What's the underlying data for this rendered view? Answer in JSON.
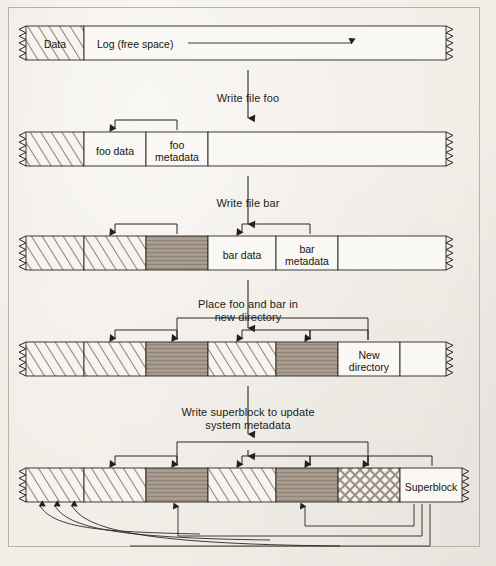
{
  "figure": {
    "kind": "log-structured-filesystem-sequence",
    "background_color": "#f2eee8",
    "ink_color": "#2b2722",
    "shade_color": "#a79c90",
    "stage_count": 5
  },
  "stages": [
    {
      "id": "stage-1",
      "y": 26,
      "transition_label": "Write file foo",
      "cells": [
        {
          "name": "data-region",
          "label": "Data",
          "pattern": "diagonal",
          "x": 26,
          "w": 58
        },
        {
          "name": "log-free-space",
          "label": "Log (free space)",
          "pattern": "empty",
          "x": 84,
          "w": 362
        }
      ]
    },
    {
      "id": "stage-2",
      "y": 132,
      "transition_label": "Write file bar",
      "cells": [
        {
          "name": "data-region",
          "label": "",
          "pattern": "diagonal",
          "x": 26,
          "w": 58
        },
        {
          "name": "foo-data",
          "label": "foo data",
          "pattern": "empty",
          "x": 84,
          "w": 62
        },
        {
          "name": "foo-metadata",
          "label": "foo\nmetadata",
          "pattern": "empty",
          "x": 146,
          "w": 62
        },
        {
          "name": "log-free-space",
          "label": "",
          "pattern": "empty",
          "x": 208,
          "w": 238
        }
      ]
    },
    {
      "id": "stage-3",
      "y": 236,
      "transition_label": "Place foo and bar in\nnew directory",
      "cells": [
        {
          "name": "data-region",
          "label": "",
          "pattern": "diagonal",
          "x": 26,
          "w": 58
        },
        {
          "name": "foo-data",
          "label": "",
          "pattern": "diagonal",
          "x": 84,
          "w": 62
        },
        {
          "name": "foo-metadata",
          "label": "",
          "pattern": "shaded",
          "x": 146,
          "w": 62
        },
        {
          "name": "bar-data",
          "label": "bar data",
          "pattern": "empty",
          "x": 208,
          "w": 68
        },
        {
          "name": "bar-metadata",
          "label": "bar\nmetadata",
          "pattern": "empty",
          "x": 276,
          "w": 62
        },
        {
          "name": "log-free-space",
          "label": "",
          "pattern": "empty",
          "x": 338,
          "w": 108
        }
      ]
    },
    {
      "id": "stage-4",
      "y": 342,
      "transition_label": "Write superblock to update\nsystem metadata",
      "cells": [
        {
          "name": "data-region",
          "label": "",
          "pattern": "diagonal",
          "x": 26,
          "w": 58
        },
        {
          "name": "foo-data",
          "label": "",
          "pattern": "diagonal",
          "x": 84,
          "w": 62
        },
        {
          "name": "foo-metadata",
          "label": "",
          "pattern": "shaded",
          "x": 146,
          "w": 62
        },
        {
          "name": "bar-data",
          "label": "",
          "pattern": "diagonal",
          "x": 208,
          "w": 68
        },
        {
          "name": "bar-metadata",
          "label": "",
          "pattern": "shaded",
          "x": 276,
          "w": 62
        },
        {
          "name": "new-directory",
          "label": "New\ndirectory",
          "pattern": "empty",
          "x": 338,
          "w": 62
        },
        {
          "name": "log-free-space",
          "label": "",
          "pattern": "empty",
          "x": 400,
          "w": 46
        }
      ]
    },
    {
      "id": "stage-5",
      "y": 468,
      "transition_label": "",
      "cells": [
        {
          "name": "data-region",
          "label": "",
          "pattern": "diagonal",
          "x": 26,
          "w": 58
        },
        {
          "name": "foo-data",
          "label": "",
          "pattern": "diagonal",
          "x": 84,
          "w": 62
        },
        {
          "name": "foo-metadata",
          "label": "",
          "pattern": "shaded",
          "x": 146,
          "w": 62
        },
        {
          "name": "bar-data",
          "label": "",
          "pattern": "diagonal",
          "x": 208,
          "w": 68
        },
        {
          "name": "bar-metadata",
          "label": "",
          "pattern": "shaded",
          "x": 276,
          "w": 62
        },
        {
          "name": "new-directory",
          "label": "",
          "pattern": "crosshatch",
          "x": 338,
          "w": 62
        },
        {
          "name": "superblock",
          "label": "Superblock",
          "pattern": "empty",
          "x": 400,
          "w": 62
        }
      ]
    }
  ],
  "log_direction_arrow": {
    "name": "log-growth-arrow",
    "label": "Log (free space)",
    "description": "arrow pointing right across the free log area"
  },
  "labels": {
    "data": "Data",
    "log_free_space": "Log (free space)",
    "foo_data": "foo data",
    "foo_metadata": "foo\nmetadata",
    "bar_data": "bar data",
    "bar_metadata": "bar\nmetadata",
    "new_directory": "New\ndirectory",
    "superblock": "Superblock",
    "write_file_foo": "Write file foo",
    "write_file_bar": "Write file bar",
    "place_foo_bar": "Place foo and bar in\nnew directory",
    "write_superblock": "Write superblock to update\nsystem metadata"
  }
}
